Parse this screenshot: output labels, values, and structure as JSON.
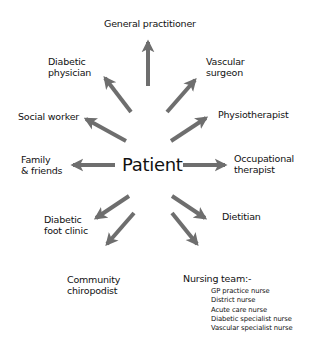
{
  "diagram": {
    "center": "Patient",
    "nodes": [
      {
        "id": "gp",
        "lines": [
          "General practitioner"
        ]
      },
      {
        "id": "diabetic-physician",
        "lines": [
          "Diabetic",
          "physician"
        ]
      },
      {
        "id": "vascular-surgeon",
        "lines": [
          "Vascular",
          "surgeon"
        ]
      },
      {
        "id": "social-worker",
        "lines": [
          "Social worker"
        ]
      },
      {
        "id": "physiotherapist",
        "lines": [
          "Physiotherapist"
        ]
      },
      {
        "id": "family",
        "lines": [
          "Family",
          "& friends"
        ]
      },
      {
        "id": "occupational-therapist",
        "lines": [
          "Occupational",
          "therapist"
        ]
      },
      {
        "id": "diabetic-foot-clinic",
        "lines": [
          "Diabetic",
          "foot clinic"
        ]
      },
      {
        "id": "dietitian",
        "lines": [
          "Dietitian"
        ]
      },
      {
        "id": "community-chiropodist",
        "lines": [
          "Community",
          "chiropodist"
        ]
      },
      {
        "id": "nursing-team",
        "lines": [
          "Nursing team:-"
        ]
      }
    ],
    "nursing_team_members": [
      "GP practice nurse",
      "District nurse",
      "Acute care nurse",
      "Diabetic specialist nurse",
      "Vascular specialist nurse"
    ],
    "arrow_color": "#6e6e6e"
  }
}
